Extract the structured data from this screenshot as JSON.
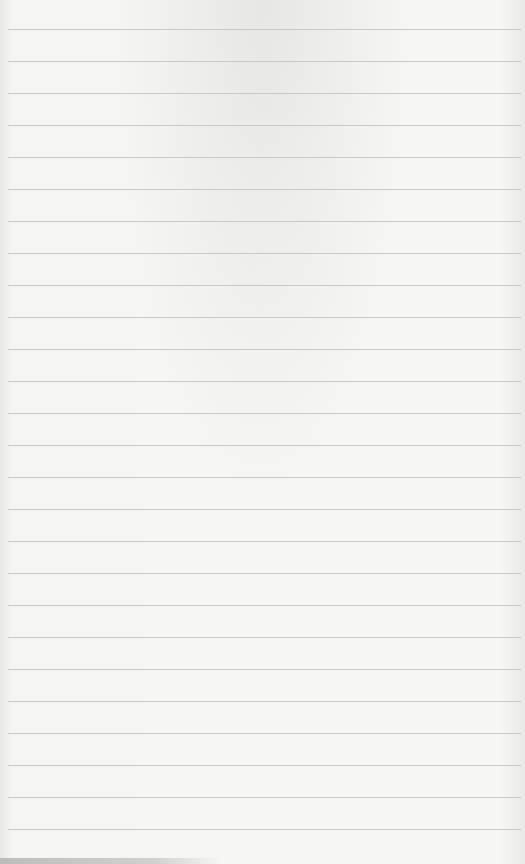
{
  "page": {
    "type": "lined-paper",
    "background_color": "#f4f4f3",
    "rule_color": "#c9c9c7",
    "rule_count": 26,
    "rule_start_y": 29,
    "rule_spacing": 32
  }
}
